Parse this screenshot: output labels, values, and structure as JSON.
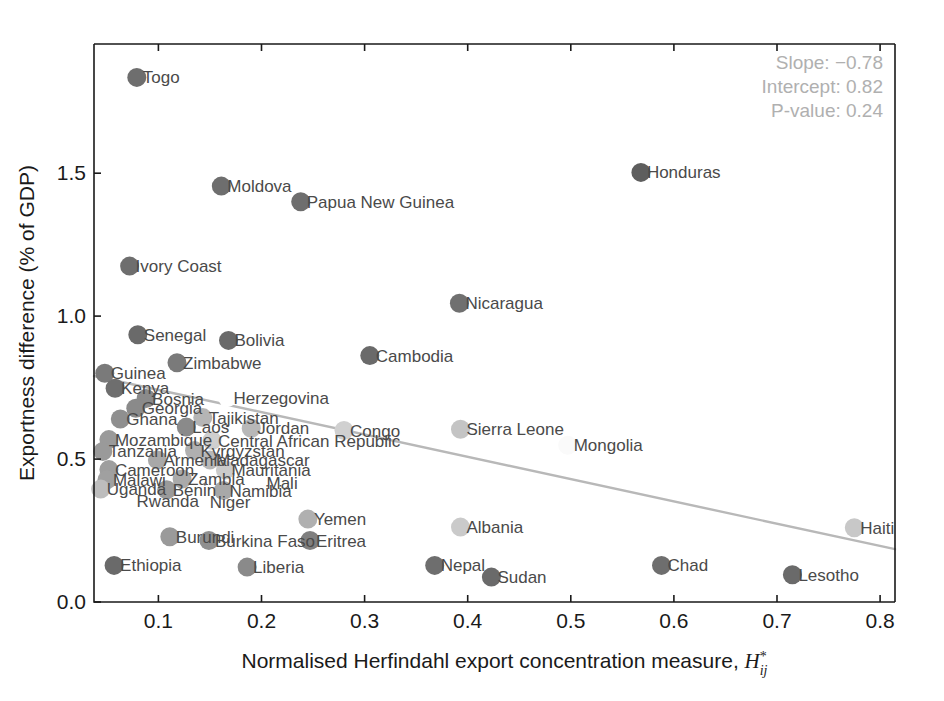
{
  "chart_data": {
    "type": "scatter",
    "title": "",
    "xlabel": "Normalised Herfindahl export concentration measure,",
    "xlabel_math": {
      "symbol": "H",
      "superscript": "*",
      "subscript": "ij"
    },
    "ylabel": "Exportness difference (% of GDP)",
    "xlim": [
      0.04,
      0.8
    ],
    "ylim": [
      0.0,
      1.9
    ],
    "xticks": [
      "0.1",
      "0.2",
      "0.3",
      "0.4",
      "0.5",
      "0.6",
      "0.7",
      "0.8"
    ],
    "xtick_values": [
      0.1,
      0.2,
      0.3,
      0.4,
      0.5,
      0.6,
      0.7,
      0.8
    ],
    "yticks": [
      "0.0",
      "0.5",
      "1.0",
      "1.5"
    ],
    "ytick_values": [
      0.0,
      0.5,
      1.0,
      1.5
    ],
    "grid": false,
    "legend": false,
    "annotations": {
      "slope_label": "Slope: −0.78",
      "intercept_label": "Intercept: 0.82",
      "pvalue_label": "P-value: 0.24",
      "slope": -0.78,
      "intercept": 0.82,
      "p_value": 0.24,
      "color": "#b0b0b0"
    },
    "trendline": {
      "slope": -0.78,
      "intercept": 0.82,
      "color": "#b8b8b8",
      "x_start": 0.04,
      "x_end": 0.8
    },
    "points": [
      {
        "label": "Togo",
        "x": 0.079,
        "y": 1.835,
        "shade": "#6e6e6e"
      },
      {
        "label": "Moldova",
        "x": 0.161,
        "y": 1.455,
        "shade": "#6e6e6e"
      },
      {
        "label": "Papua New Guinea",
        "x": 0.238,
        "y": 1.4,
        "shade": "#6e6e6e"
      },
      {
        "label": "Honduras",
        "x": 0.568,
        "y": 1.503,
        "shade": "#5e5e5e"
      },
      {
        "label": "Ivory Coast",
        "x": 0.072,
        "y": 1.175,
        "shade": "#6e6e6e"
      },
      {
        "label": "Nicaragua",
        "x": 0.392,
        "y": 1.045,
        "shade": "#707070"
      },
      {
        "label": "Senegal",
        "x": 0.08,
        "y": 0.935,
        "shade": "#6a6a6a"
      },
      {
        "label": "Bolivia",
        "x": 0.168,
        "y": 0.915,
        "shade": "#6a6a6a"
      },
      {
        "label": "Cambodia",
        "x": 0.305,
        "y": 0.862,
        "shade": "#6a6a6a"
      },
      {
        "label": "Zimbabwe",
        "x": 0.118,
        "y": 0.837,
        "shade": "#7a7a7a"
      },
      {
        "label": "Guinea",
        "x": 0.048,
        "y": 0.8,
        "shade": "#7a7a7a"
      },
      {
        "label": "Kenya",
        "x": 0.058,
        "y": 0.748,
        "shade": "#6e6e6e"
      },
      {
        "label": "Bosnia",
        "x": 0.088,
        "y": 0.712,
        "shade": "#8a8a8a"
      },
      {
        "label": "Herzegovina",
        "x": 0.167,
        "y": 0.715,
        "shade": "#ffffff"
      },
      {
        "label": "Georgia",
        "x": 0.078,
        "y": 0.678,
        "shade": "#8a8a8a"
      },
      {
        "label": "Tajikistan",
        "x": 0.143,
        "y": 0.645,
        "shade": "#b5b5b5"
      },
      {
        "label": "Ghana",
        "x": 0.063,
        "y": 0.64,
        "shade": "#8f8f8f"
      },
      {
        "label": "Laos",
        "x": 0.127,
        "y": 0.612,
        "shade": "#8a8a8a"
      },
      {
        "label": "Jordan",
        "x": 0.19,
        "y": 0.608,
        "shade": "#b8b8b8"
      },
      {
        "label": "Congo",
        "x": 0.28,
        "y": 0.6,
        "shade": "#d0d0d0"
      },
      {
        "label": "Sierra Leone",
        "x": 0.393,
        "y": 0.604,
        "shade": "#c4c4c4"
      },
      {
        "label": "Mozambique",
        "x": 0.052,
        "y": 0.568,
        "shade": "#9a9a9a"
      },
      {
        "label": "Central African Republic",
        "x": 0.152,
        "y": 0.565,
        "shade": "#cfcfcf"
      },
      {
        "label": "Mongolia",
        "x": 0.497,
        "y": 0.548,
        "shade": "#fafafa"
      },
      {
        "label": "Tanzania",
        "x": 0.046,
        "y": 0.527,
        "shade": "#9a9a9a"
      },
      {
        "label": "Kyrgyzstan",
        "x": 0.135,
        "y": 0.53,
        "shade": "#b0b0b0"
      },
      {
        "label": "Armenia",
        "x": 0.099,
        "y": 0.497,
        "shade": "#a8a8a8"
      },
      {
        "label": "Madagascar",
        "x": 0.15,
        "y": 0.497,
        "shade": "#b8b8b8"
      },
      {
        "label": "Cameroon",
        "x": 0.052,
        "y": 0.463,
        "shade": "#9e9e9e"
      },
      {
        "label": "Mauritania",
        "x": 0.165,
        "y": 0.462,
        "shade": "#cacaca"
      },
      {
        "label": "Malawi",
        "x": 0.05,
        "y": 0.427,
        "shade": "#a0a0a0"
      },
      {
        "label": "Zambia",
        "x": 0.123,
        "y": 0.43,
        "shade": "#aaaaaa"
      },
      {
        "label": "Mali",
        "x": 0.199,
        "y": 0.415,
        "shade": "#ffffff"
      },
      {
        "label": "Uganda",
        "x": 0.044,
        "y": 0.395,
        "shade": "#bdbdbd"
      },
      {
        "label": "Benin",
        "x": 0.108,
        "y": 0.393,
        "shade": "#9a9a9a"
      },
      {
        "label": "Namibia",
        "x": 0.163,
        "y": 0.39,
        "shade": "#a8a8a8"
      },
      {
        "label": "Rwanda",
        "x": 0.073,
        "y": 0.353,
        "shade": "#ffffff"
      },
      {
        "label": "Niger",
        "x": 0.144,
        "y": 0.35,
        "shade": "#ffffff"
      },
      {
        "label": "Yemen",
        "x": 0.245,
        "y": 0.29,
        "shade": "#b0b0b0"
      },
      {
        "label": "Albania",
        "x": 0.393,
        "y": 0.262,
        "shade": "#cacaca"
      },
      {
        "label": "Haiti",
        "x": 0.775,
        "y": 0.26,
        "shade": "#c8c8c8"
      },
      {
        "label": "Burundi",
        "x": 0.111,
        "y": 0.228,
        "shade": "#9a9a9a"
      },
      {
        "label": "Burkina Faso",
        "x": 0.149,
        "y": 0.215,
        "shade": "#8f8f8f"
      },
      {
        "label": "Eritrea",
        "x": 0.247,
        "y": 0.215,
        "shade": "#7f7f7f"
      },
      {
        "label": "Nepal",
        "x": 0.368,
        "y": 0.128,
        "shade": "#6e6e6e"
      },
      {
        "label": "Chad",
        "x": 0.588,
        "y": 0.128,
        "shade": "#6e6e6e"
      },
      {
        "label": "Ethiopia",
        "x": 0.057,
        "y": 0.128,
        "shade": "#6a6a6a"
      },
      {
        "label": "Liberia",
        "x": 0.186,
        "y": 0.122,
        "shade": "#8a8a8a"
      },
      {
        "label": "Sudan",
        "x": 0.423,
        "y": 0.087,
        "shade": "#6a6a6a"
      },
      {
        "label": "Lesotho",
        "x": 0.715,
        "y": 0.095,
        "shade": "#6a6a6a"
      }
    ]
  }
}
